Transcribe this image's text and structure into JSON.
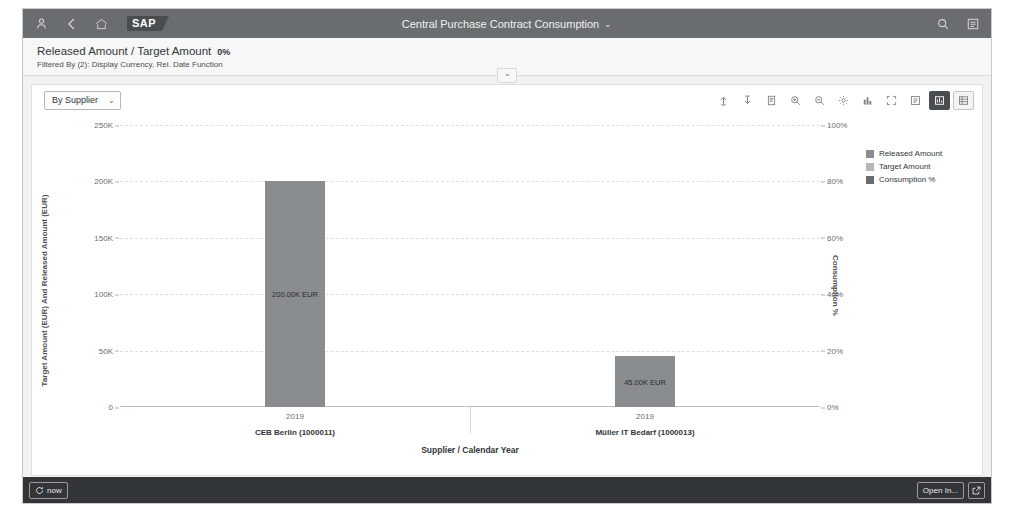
{
  "shellbar": {
    "icons": [
      {
        "name": "user-icon"
      },
      {
        "name": "back-icon"
      },
      {
        "name": "home-icon"
      }
    ],
    "logo_text": "SAP",
    "title": "Central Purchase Contract Consumption",
    "title_chevron": "⌄",
    "right_icons": [
      {
        "name": "search-icon"
      },
      {
        "name": "overflow-menu-icon"
      }
    ]
  },
  "subheader": {
    "kpi_title": "Released Amount / Target Amount",
    "kpi_value": "0%",
    "filter_text": "Filtered By (2): Display Currency, Rel. Date Function",
    "collapse_chevron": "⌄"
  },
  "chart_toolbar": {
    "dimension_label": "By Supplier",
    "dimension_chevron": "⌄",
    "icons": [
      {
        "name": "drill-up-icon",
        "active": false
      },
      {
        "name": "drill-down-icon",
        "active": false
      },
      {
        "name": "details-icon",
        "active": false
      },
      {
        "name": "zoom-in-icon",
        "active": false
      },
      {
        "name": "zoom-out-icon",
        "active": false
      },
      {
        "name": "settings-gear-icon",
        "active": false
      },
      {
        "name": "chart-type-icon",
        "active": false
      },
      {
        "name": "full-screen-icon",
        "active": false
      },
      {
        "name": "legend-icon",
        "active": false
      },
      {
        "name": "chart-view-icon",
        "active": true
      },
      {
        "name": "table-view-icon",
        "active": false
      }
    ]
  },
  "legend": {
    "items": [
      {
        "label": "Released Amount",
        "color": "#8a8d90"
      },
      {
        "label": "Target Amount",
        "color": "#b5b8bb"
      },
      {
        "label": "Consumption %",
        "color": "#6a6d70"
      }
    ]
  },
  "chart_data": {
    "type": "bar",
    "title": "",
    "xlabel": "Supplier / Calendar Year",
    "ylabel": "Target Amount (EUR) And Released Amount (EUR)",
    "y2label": "Consumption %",
    "ylim": [
      0,
      250000
    ],
    "y2lim": [
      0,
      100
    ],
    "grid": true,
    "legend_position": "right",
    "yticks": [
      {
        "value": 0,
        "label": "0"
      },
      {
        "value": 50000,
        "label": "50K"
      },
      {
        "value": 100000,
        "label": "100K"
      },
      {
        "value": 150000,
        "label": "150K"
      },
      {
        "value": 200000,
        "label": "200K"
      },
      {
        "value": 250000,
        "label": "250K"
      }
    ],
    "y2ticks": [
      {
        "value": 0,
        "label": "0%"
      },
      {
        "value": 20,
        "label": "20%"
      },
      {
        "value": 40,
        "label": "40%"
      },
      {
        "value": 60,
        "label": "60%"
      },
      {
        "value": 80,
        "label": "80%"
      },
      {
        "value": 100,
        "label": "100%"
      }
    ],
    "categories": [
      {
        "supplier": "CEB Berlin (1000011)",
        "year": "2019"
      },
      {
        "supplier": "Müller IT Bedarf (1000013)",
        "year": "2019"
      }
    ],
    "series": [
      {
        "name": "Target Amount",
        "color": "#8a8d90",
        "values": [
          200000,
          45000
        ],
        "data_labels": [
          "200.00K EUR",
          "45.00K EUR"
        ]
      },
      {
        "name": "Released Amount",
        "color": "#8a8d90",
        "values": [
          0,
          0
        ],
        "data_labels": [
          "",
          ""
        ]
      },
      {
        "name": "Consumption %",
        "color": "#6a6d70",
        "values": [
          0,
          0
        ],
        "data_labels": [
          "",
          ""
        ]
      }
    ]
  },
  "footer": {
    "left_button_label": "now",
    "open_in_label": "Open In...",
    "external_icon": "external-link-icon"
  }
}
